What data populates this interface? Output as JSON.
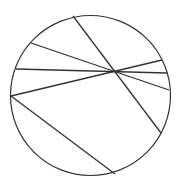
{
  "diagram": {
    "type": "circle-with-chords",
    "stroke_color": "#333333",
    "background": "#ffffff",
    "circle": {
      "cx": 90.5,
      "cy": 95.5,
      "r": 80
    },
    "intersection_point": {
      "x": 114,
      "y": 71
    },
    "chords": [
      {
        "id": "chord-1",
        "x1": 73,
        "y1": 16,
        "x2": 161,
        "y2": 133
      },
      {
        "id": "chord-2",
        "x1": 31,
        "y1": 43,
        "x2": 169,
        "y2": 90
      },
      {
        "id": "chord-3",
        "x1": 16,
        "y1": 69,
        "x2": 167,
        "y2": 73
      },
      {
        "id": "chord-4",
        "x1": 11,
        "y1": 96,
        "x2": 162,
        "y2": 60
      },
      {
        "id": "chord-5",
        "x1": 11,
        "y1": 96,
        "x2": 115,
        "y2": 174
      }
    ]
  }
}
